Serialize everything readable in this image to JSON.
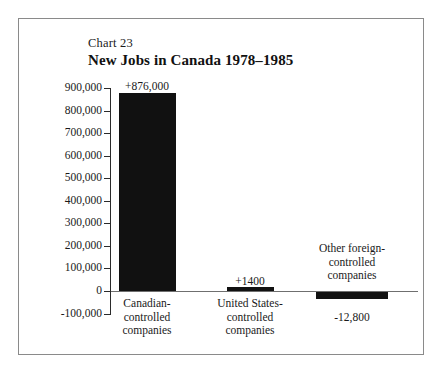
{
  "chart_data": {
    "type": "bar",
    "title": "New Jobs in Canada 1978–1985",
    "chart_number": "Chart 23",
    "xlabel": "",
    "ylabel": "",
    "ylim": [
      -100000,
      900000
    ],
    "ytick_interval": 100000,
    "grid": false,
    "legend": "none",
    "categories": [
      "Canadian-controlled companies",
      "United States-controlled companies",
      "Other foreign-controlled companies"
    ],
    "values": [
      876000,
      1400,
      -12800
    ],
    "data_labels": [
      "+876,000",
      "+1400",
      "-12,800"
    ],
    "ytick_labels": [
      "900,000",
      "800,000",
      "700,000",
      "600,000",
      "500,000",
      "400,000",
      "300,000",
      "200,000",
      "100,000",
      "0",
      "-100,000"
    ]
  },
  "categories_wrapped": [
    [
      "Canadian-",
      "controlled",
      "companies"
    ],
    [
      "United States-",
      "controlled",
      "companies"
    ],
    [
      "Other foreign-",
      "controlled",
      "companies"
    ]
  ],
  "colors": {
    "bar": "#111111",
    "axis": "#2b2b2b",
    "baseline": "#6f6f6f",
    "frame": "#8a8a8a",
    "background": "#ffffff",
    "text": "#1a1a1a"
  }
}
